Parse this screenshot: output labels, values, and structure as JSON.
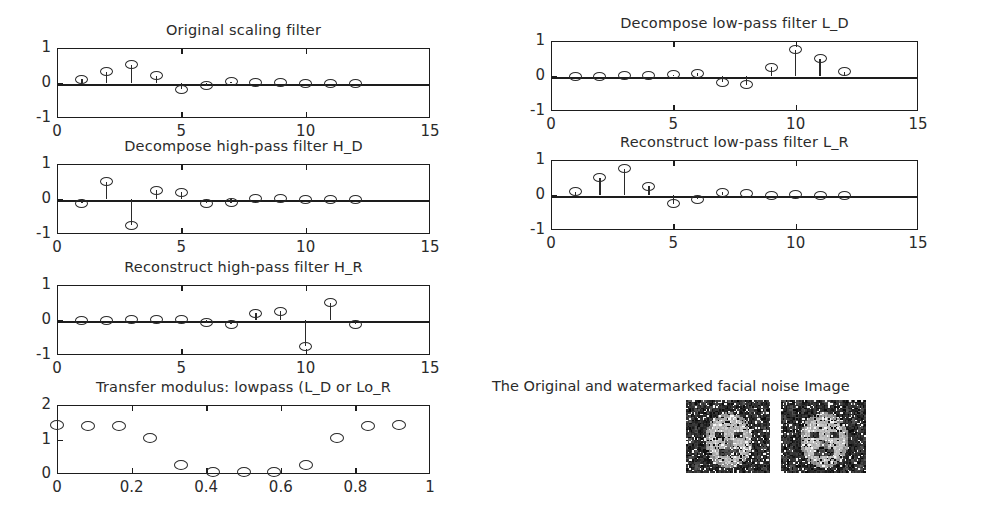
{
  "figure": {
    "background": "#ffffff",
    "line_color": "#1d1d1d",
    "marker_color": "#2a2a2a"
  },
  "panels": [
    {
      "name": "original-scaling-filter",
      "title": "Original scaling filter",
      "box": {
        "left": 57,
        "top": 48,
        "width": 373,
        "height": 70
      }
    },
    {
      "name": "decompose-lowpass-filter",
      "title": "Decompose low-pass filter L_D",
      "box": {
        "left": 551,
        "top": 41,
        "width": 367,
        "height": 70
      }
    },
    {
      "name": "decompose-highpass-filter",
      "title": "Decompose high-pass filter H_D",
      "box": {
        "left": 57,
        "top": 164,
        "width": 373,
        "height": 70
      }
    },
    {
      "name": "reconstruct-lowpass-filter",
      "title": "Reconstruct low-pass filter L_R",
      "box": {
        "left": 551,
        "top": 160,
        "width": 367,
        "height": 70
      }
    },
    {
      "name": "reconstruct-highpass-filter",
      "title": "Reconstruct high-pass filter H_R",
      "box": {
        "left": 57,
        "top": 285,
        "width": 373,
        "height": 70
      }
    },
    {
      "name": "transfer-modulus-lowpass",
      "title": "Transfer modulus: lowpass (L_D or Lo_R",
      "box": {
        "left": 57,
        "top": 405,
        "width": 373,
        "height": 69
      }
    }
  ],
  "image_block": {
    "caption": "The Original and watermarked facial noise Image",
    "images": [
      {
        "name": "original-facial-noise-image",
        "left": 686,
        "top": 400,
        "width": 84,
        "height": 73
      },
      {
        "name": "watermarked-facial-noise-image",
        "left": 781,
        "top": 400,
        "width": 85,
        "height": 73
      }
    ]
  },
  "chart_data": [
    {
      "type": "stem",
      "name": "original-scaling-filter",
      "title": "Original scaling filter",
      "xlabel": "",
      "ylabel": "",
      "xlim": [
        0,
        15
      ],
      "ylim": [
        -1,
        1
      ],
      "xticks": [
        0,
        5,
        10,
        15
      ],
      "xticklabels": [
        "0",
        "5",
        "10",
        "15"
      ],
      "yticks": [
        -1,
        0,
        1
      ],
      "yticklabels": [
        "-1",
        "0",
        "1"
      ],
      "grid": false,
      "x": [
        1,
        2,
        3,
        4,
        5,
        6,
        7,
        8,
        9,
        10,
        11,
        12
      ],
      "values": [
        0.11,
        0.32,
        0.52,
        0.21,
        -0.18,
        -0.08,
        0.04,
        0.02,
        0.01,
        0.0,
        0.0,
        0.0
      ]
    },
    {
      "type": "stem",
      "name": "decompose-lowpass-filter",
      "title": "Decompose low-pass filter L_D",
      "xlabel": "",
      "ylabel": "",
      "xlim": [
        0,
        15
      ],
      "ylim": [
        -1,
        1
      ],
      "xticks": [
        0,
        5,
        10,
        15
      ],
      "xticklabels": [
        "0",
        "5",
        "10",
        "15"
      ],
      "yticks": [
        -1,
        0,
        1
      ],
      "yticklabels": [
        "-1",
        "0",
        "1"
      ],
      "grid": false,
      "x": [
        1,
        2,
        3,
        4,
        5,
        6,
        7,
        8,
        9,
        10,
        11,
        12
      ],
      "values": [
        0.0,
        0.0,
        0.01,
        0.02,
        0.04,
        0.08,
        -0.18,
        -0.25,
        0.25,
        0.75,
        0.5,
        0.12
      ]
    },
    {
      "type": "stem",
      "name": "decompose-highpass-filter",
      "title": "Decompose high-pass filter H_D",
      "xlabel": "",
      "ylabel": "",
      "xlim": [
        0,
        15
      ],
      "ylim": [
        -1,
        1
      ],
      "xticks": [
        0,
        5,
        10,
        15
      ],
      "xticklabels": [
        "0",
        "5",
        "10",
        "15"
      ],
      "yticks": [
        -1,
        0,
        1
      ],
      "yticklabels": [
        "-1",
        "0",
        "1"
      ],
      "grid": false,
      "x": [
        1,
        2,
        3,
        4,
        5,
        6,
        7,
        8,
        9,
        10,
        11,
        12
      ],
      "values": [
        -0.12,
        0.5,
        -0.75,
        0.25,
        0.2,
        -0.12,
        -0.1,
        0.02,
        0.01,
        0.0,
        0.0,
        0.0
      ]
    },
    {
      "type": "stem",
      "name": "reconstruct-lowpass-filter",
      "title": "Reconstruct low-pass filter L_R",
      "xlabel": "",
      "ylabel": "",
      "xlim": [
        0,
        15
      ],
      "ylim": [
        -1,
        1
      ],
      "xticks": [
        0,
        5,
        10,
        15
      ],
      "xticklabels": [
        "0",
        "5",
        "10",
        "15"
      ],
      "yticks": [
        -1,
        0,
        1
      ],
      "yticklabels": [
        "-1",
        "0",
        "1"
      ],
      "grid": false,
      "x": [
        1,
        2,
        3,
        4,
        5,
        6,
        7,
        8,
        9,
        10,
        11,
        12
      ],
      "values": [
        0.1,
        0.5,
        0.75,
        0.25,
        -0.25,
        -0.12,
        0.08,
        0.03,
        0.0,
        0.01,
        0.0,
        0.0
      ]
    },
    {
      "type": "stem",
      "name": "reconstruct-highpass-filter",
      "title": "Reconstruct high-pass filter H_R",
      "xlabel": "",
      "ylabel": "",
      "xlim": [
        0,
        15
      ],
      "ylim": [
        -1,
        1
      ],
      "xticks": [
        0,
        5,
        10,
        15
      ],
      "xticklabels": [
        "0",
        "5",
        "10",
        "15"
      ],
      "yticks": [
        -1,
        0,
        1
      ],
      "yticklabels": [
        "-1",
        "0",
        "1"
      ],
      "grid": false,
      "x": [
        1,
        2,
        3,
        4,
        5,
        6,
        7,
        8,
        9,
        10,
        11,
        12
      ],
      "values": [
        0.0,
        0.0,
        0.01,
        0.02,
        0.02,
        -0.08,
        -0.12,
        0.2,
        0.25,
        -0.75,
        0.5,
        -0.12
      ]
    },
    {
      "type": "scatter",
      "name": "transfer-modulus-lowpass",
      "title": "Transfer modulus: lowpass (L_D or Lo_R",
      "xlabel": "",
      "ylabel": "",
      "xlim": [
        0,
        1
      ],
      "ylim": [
        0,
        2
      ],
      "xticks": [
        0,
        0.2,
        0.4,
        0.6,
        0.8,
        1
      ],
      "xticklabels": [
        "0",
        "0.2",
        "0.4",
        "0.6",
        "0.8",
        "1"
      ],
      "yticks": [
        0,
        1,
        2
      ],
      "yticklabels": [
        "0",
        "1",
        "2"
      ],
      "grid": false,
      "x": [
        0.0,
        0.083,
        0.167,
        0.25,
        0.333,
        0.417,
        0.5,
        0.583,
        0.667,
        0.75,
        0.833,
        0.917
      ],
      "values": [
        1.42,
        1.4,
        1.38,
        1.05,
        0.27,
        0.06,
        0.05,
        0.06,
        0.27,
        1.03,
        1.4,
        1.42
      ]
    }
  ]
}
